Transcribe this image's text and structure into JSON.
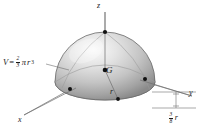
{
  "figure": {
    "type": "3d-solid-diagram",
    "background_color": "#ffffff",
    "ink_color": "#1a1a1a"
  },
  "axes": [
    {
      "name": "z-axis",
      "label": "z",
      "direction": "up"
    },
    {
      "name": "y-axis",
      "label": "y",
      "direction": "right-down"
    },
    {
      "name": "x-axis",
      "label": "x",
      "direction": "left-down"
    }
  ],
  "labels": {
    "z": "z",
    "y": "y",
    "x": "x",
    "centroid": "G",
    "radius": "r"
  },
  "volume_formula": {
    "variable": "V",
    "equals": "=",
    "fraction_numerator": "2",
    "fraction_denominator": "3",
    "pi": "π",
    "radius_symbol": "r",
    "exponent": "3",
    "plain": "V = 2/3 πr³"
  },
  "centroid_dimension": {
    "fraction_numerator": "3",
    "fraction_denominator": "8",
    "radius_symbol": "r",
    "plain": "3/8 r"
  },
  "markers": [
    {
      "name": "apex-point",
      "at": "top of dome on z-axis"
    },
    {
      "name": "centroid-point",
      "at": "center G"
    },
    {
      "name": "x-axis-pierce-point",
      "at": "front-left of base"
    },
    {
      "name": "y-axis-pierce-point",
      "at": "right of base"
    },
    {
      "name": "base-point",
      "at": "bottom of radius line"
    }
  ],
  "colors": {
    "surface_light": "#f2f2f2",
    "surface_mid": "#c8c8c8",
    "surface_dark": "#8f8f8f",
    "outline": "#5a5a5a",
    "axis_line": "#6e6e6e",
    "ink": "#1a1a1a"
  }
}
